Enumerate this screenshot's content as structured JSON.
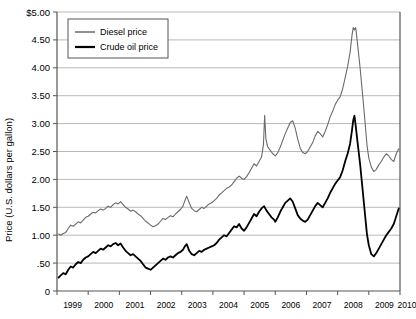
{
  "chart_data": {
    "type": "line",
    "title": "",
    "xlabel": "",
    "ylabel": "Price (U.S. dollars per gallon)",
    "xlim": [
      1999,
      2010
    ],
    "ylim": [
      0,
      5
    ],
    "grid": true,
    "legend_position": "top-left",
    "y_ticks": [
      "$5.00",
      "4.50",
      "4.00",
      "3.50",
      "3.00",
      "2.50",
      "2.00",
      "1.50",
      "1.00",
      ".50",
      "0"
    ],
    "y_tick_values": [
      5.0,
      4.5,
      4.0,
      3.5,
      3.0,
      2.5,
      2.0,
      1.5,
      1.0,
      0.5,
      0
    ],
    "x_ticks": [
      "1999",
      "2000",
      "2001",
      "2002",
      "2003",
      "2004",
      "2005",
      "2006",
      "2007",
      "2008",
      "2009",
      "2010"
    ],
    "x_tick_values": [
      1999,
      2000,
      2001,
      2002,
      2003,
      2004,
      2005,
      2006,
      2007,
      2008,
      2009,
      2010
    ],
    "series": [
      {
        "name": "Diesel price",
        "color": "#6b6b6b",
        "width": 1.1,
        "x": [
          1999.05,
          1999.12,
          1999.2,
          1999.28,
          1999.36,
          1999.44,
          1999.52,
          1999.6,
          1999.68,
          1999.76,
          1999.84,
          1999.92,
          2000.0,
          2000.08,
          2000.16,
          2000.24,
          2000.32,
          2000.4,
          2000.48,
          2000.56,
          2000.64,
          2000.72,
          2000.8,
          2000.88,
          2000.96,
          2001.04,
          2001.12,
          2001.2,
          2001.28,
          2001.36,
          2001.44,
          2001.52,
          2001.6,
          2001.68,
          2001.76,
          2001.84,
          2001.92,
          2002.0,
          2002.08,
          2002.16,
          2002.24,
          2002.32,
          2002.4,
          2002.48,
          2002.56,
          2002.64,
          2002.72,
          2002.8,
          2002.88,
          2002.96,
          2003.04,
          2003.1,
          2003.16,
          2003.24,
          2003.32,
          2003.4,
          2003.48,
          2003.56,
          2003.64,
          2003.72,
          2003.8,
          2003.88,
          2003.96,
          2004.04,
          2004.12,
          2004.2,
          2004.28,
          2004.36,
          2004.44,
          2004.52,
          2004.6,
          2004.68,
          2004.76,
          2004.84,
          2004.92,
          2005.0,
          2005.08,
          2005.16,
          2005.24,
          2005.32,
          2005.4,
          2005.48,
          2005.56,
          2005.62,
          2005.66,
          2005.7,
          2005.76,
          2005.84,
          2005.92,
          2006.0,
          2006.08,
          2006.16,
          2006.24,
          2006.32,
          2006.4,
          2006.48,
          2006.56,
          2006.64,
          2006.72,
          2006.8,
          2006.88,
          2006.96,
          2007.04,
          2007.12,
          2007.2,
          2007.28,
          2007.36,
          2007.44,
          2007.52,
          2007.6,
          2007.68,
          2007.76,
          2007.84,
          2007.92,
          2008.0,
          2008.08,
          2008.16,
          2008.24,
          2008.32,
          2008.4,
          2008.46,
          2008.5,
          2008.54,
          2008.58,
          2008.64,
          2008.72,
          2008.8,
          2008.88,
          2008.94,
          2009.0,
          2009.08,
          2009.16,
          2009.24,
          2009.32,
          2009.4,
          2009.48,
          2009.56,
          2009.64,
          2009.72,
          2009.8,
          2009.88,
          2009.96
        ],
        "y": [
          1.02,
          1.0,
          1.03,
          1.05,
          1.12,
          1.18,
          1.16,
          1.2,
          1.24,
          1.22,
          1.27,
          1.32,
          1.34,
          1.38,
          1.41,
          1.4,
          1.44,
          1.47,
          1.45,
          1.48,
          1.52,
          1.5,
          1.55,
          1.58,
          1.56,
          1.6,
          1.55,
          1.5,
          1.47,
          1.43,
          1.45,
          1.42,
          1.38,
          1.35,
          1.3,
          1.25,
          1.22,
          1.18,
          1.15,
          1.17,
          1.2,
          1.25,
          1.3,
          1.28,
          1.32,
          1.35,
          1.33,
          1.38,
          1.42,
          1.46,
          1.52,
          1.62,
          1.7,
          1.58,
          1.48,
          1.44,
          1.42,
          1.46,
          1.5,
          1.48,
          1.52,
          1.56,
          1.58,
          1.62,
          1.66,
          1.72,
          1.76,
          1.8,
          1.84,
          1.86,
          1.9,
          1.96,
          2.02,
          2.06,
          2.02,
          2.0,
          2.05,
          2.12,
          2.2,
          2.28,
          2.24,
          2.32,
          2.4,
          2.62,
          3.15,
          2.72,
          2.58,
          2.52,
          2.46,
          2.42,
          2.48,
          2.58,
          2.7,
          2.82,
          2.92,
          3.02,
          3.05,
          2.92,
          2.72,
          2.56,
          2.48,
          2.46,
          2.5,
          2.58,
          2.66,
          2.78,
          2.86,
          2.82,
          2.76,
          2.86,
          2.98,
          3.12,
          3.22,
          3.34,
          3.42,
          3.48,
          3.62,
          3.82,
          4.02,
          4.28,
          4.58,
          4.72,
          4.68,
          4.72,
          4.42,
          4.0,
          3.52,
          3.02,
          2.62,
          2.38,
          2.22,
          2.14,
          2.18,
          2.26,
          2.32,
          2.4,
          2.46,
          2.42,
          2.36,
          2.32,
          2.46,
          2.55
        ]
      },
      {
        "name": "Crude oil price",
        "color": "#000000",
        "width": 1.8,
        "x": [
          1999.05,
          1999.12,
          1999.2,
          1999.28,
          1999.36,
          1999.44,
          1999.52,
          1999.6,
          1999.68,
          1999.76,
          1999.84,
          1999.92,
          2000.0,
          2000.08,
          2000.16,
          2000.24,
          2000.32,
          2000.4,
          2000.48,
          2000.56,
          2000.64,
          2000.72,
          2000.8,
          2000.88,
          2000.96,
          2001.04,
          2001.12,
          2001.2,
          2001.28,
          2001.36,
          2001.44,
          2001.52,
          2001.6,
          2001.68,
          2001.76,
          2001.84,
          2001.92,
          2002.0,
          2002.08,
          2002.16,
          2002.24,
          2002.32,
          2002.4,
          2002.48,
          2002.56,
          2002.64,
          2002.72,
          2002.8,
          2002.88,
          2002.96,
          2003.04,
          2003.1,
          2003.16,
          2003.24,
          2003.32,
          2003.4,
          2003.48,
          2003.56,
          2003.64,
          2003.72,
          2003.8,
          2003.88,
          2003.96,
          2004.04,
          2004.12,
          2004.2,
          2004.28,
          2004.36,
          2004.44,
          2004.52,
          2004.6,
          2004.68,
          2004.76,
          2004.84,
          2004.92,
          2005.0,
          2005.08,
          2005.16,
          2005.24,
          2005.32,
          2005.4,
          2005.48,
          2005.56,
          2005.64,
          2005.72,
          2005.8,
          2005.88,
          2005.96,
          2006.0,
          2006.08,
          2006.16,
          2006.24,
          2006.32,
          2006.4,
          2006.48,
          2006.56,
          2006.64,
          2006.72,
          2006.8,
          2006.88,
          2006.96,
          2007.04,
          2007.12,
          2007.2,
          2007.28,
          2007.36,
          2007.44,
          2007.52,
          2007.6,
          2007.68,
          2007.76,
          2007.84,
          2007.92,
          2008.0,
          2008.08,
          2008.16,
          2008.24,
          2008.32,
          2008.4,
          2008.46,
          2008.5,
          2008.54,
          2008.58,
          2008.64,
          2008.72,
          2008.8,
          2008.88,
          2008.94,
          2009.0,
          2009.08,
          2009.16,
          2009.24,
          2009.32,
          2009.4,
          2009.48,
          2009.56,
          2009.64,
          2009.72,
          2009.8,
          2009.88,
          2009.96
        ],
        "y": [
          0.24,
          0.28,
          0.32,
          0.3,
          0.38,
          0.44,
          0.42,
          0.48,
          0.52,
          0.5,
          0.56,
          0.6,
          0.62,
          0.66,
          0.7,
          0.68,
          0.72,
          0.76,
          0.74,
          0.78,
          0.82,
          0.8,
          0.84,
          0.86,
          0.82,
          0.85,
          0.78,
          0.72,
          0.68,
          0.64,
          0.66,
          0.62,
          0.58,
          0.54,
          0.48,
          0.42,
          0.4,
          0.38,
          0.42,
          0.46,
          0.5,
          0.54,
          0.58,
          0.56,
          0.6,
          0.62,
          0.6,
          0.64,
          0.68,
          0.7,
          0.74,
          0.8,
          0.84,
          0.72,
          0.66,
          0.64,
          0.68,
          0.72,
          0.7,
          0.74,
          0.76,
          0.78,
          0.8,
          0.82,
          0.86,
          0.92,
          0.96,
          1.0,
          0.98,
          1.04,
          1.1,
          1.16,
          1.14,
          1.2,
          1.12,
          1.08,
          1.14,
          1.22,
          1.3,
          1.38,
          1.34,
          1.42,
          1.48,
          1.52,
          1.44,
          1.38,
          1.32,
          1.28,
          1.24,
          1.32,
          1.42,
          1.5,
          1.58,
          1.62,
          1.66,
          1.6,
          1.48,
          1.36,
          1.3,
          1.26,
          1.24,
          1.28,
          1.36,
          1.44,
          1.52,
          1.58,
          1.54,
          1.5,
          1.58,
          1.66,
          1.76,
          1.84,
          1.92,
          1.98,
          2.04,
          2.16,
          2.32,
          2.46,
          2.64,
          2.88,
          3.06,
          3.14,
          2.96,
          2.66,
          2.28,
          1.82,
          1.36,
          1.02,
          0.82,
          0.66,
          0.62,
          0.68,
          0.76,
          0.84,
          0.92,
          1.0,
          1.06,
          1.12,
          1.2,
          1.34,
          1.48
        ]
      }
    ]
  },
  "legend": {
    "items": [
      {
        "label": "Diesel price"
      },
      {
        "label": "Crude oil price"
      }
    ]
  }
}
